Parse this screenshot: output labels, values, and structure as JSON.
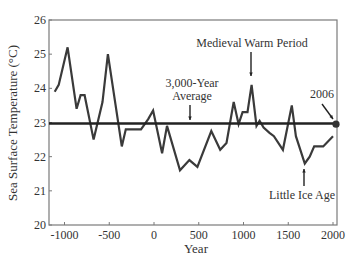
{
  "chart_data": {
    "type": "line",
    "title": "",
    "xlabel": "Year",
    "ylabel": "Sea Surface Temperature (°C)",
    "xlim": [
      -1150,
      2000
    ],
    "ylim": [
      20,
      26
    ],
    "x_ticks": [
      -1000,
      -500,
      0,
      500,
      1000,
      1500,
      2000
    ],
    "x_tick_labels": [
      "-1000",
      "-500",
      "0",
      "500",
      "1000",
      "1500",
      "2000"
    ],
    "y_ticks": [
      20,
      21,
      22,
      23,
      24,
      25,
      26
    ],
    "y_tick_labels": [
      "20",
      "21",
      "22",
      "23",
      "24",
      "25",
      "26"
    ],
    "grid": false,
    "legend": null,
    "series": [
      {
        "name": "Sea Surface Temperature",
        "x": [
          -1110,
          -1065,
          -965,
          -865,
          -820,
          -775,
          -675,
          -575,
          -515,
          -360,
          -315,
          -145,
          -65,
          -10,
          90,
          145,
          290,
          395,
          485,
          640,
          740,
          810,
          890,
          945,
          990,
          1045,
          1090,
          1145,
          1180,
          1225,
          1290,
          1340,
          1440,
          1540,
          1585,
          1685,
          1740,
          1790,
          1890,
          2000
        ],
        "y": [
          23.9,
          24.1,
          25.2,
          23.4,
          23.8,
          23.8,
          22.5,
          23.6,
          25.0,
          22.3,
          22.8,
          22.8,
          23.1,
          23.35,
          22.1,
          22.9,
          21.6,
          21.9,
          21.7,
          22.75,
          22.2,
          22.4,
          23.6,
          22.95,
          23.3,
          23.3,
          24.1,
          22.9,
          23.05,
          22.85,
          22.7,
          22.6,
          22.2,
          23.5,
          22.6,
          21.8,
          22.0,
          22.3,
          22.3,
          22.6
        ],
        "color": "#3a3a3a"
      },
      {
        "name": "3,000-Year Average",
        "x": [
          -1150,
          2000
        ],
        "y": [
          22.97,
          22.97
        ],
        "color": "#222222"
      }
    ],
    "markers": [
      {
        "label": "2006",
        "x": 2006,
        "y": 22.95
      }
    ],
    "annotations": [
      {
        "text": "Medieval Warm Period",
        "target_x": 1090,
        "target_y": 24.1
      },
      {
        "text_lines": [
          "3,000-Year",
          "Average"
        ],
        "target_x": 400,
        "target_y": 22.97
      },
      {
        "text": "2006",
        "target_x": 2006,
        "target_y": 22.95
      },
      {
        "text": "Little Ice Age",
        "target_x": 1685,
        "target_y": 21.8
      }
    ]
  }
}
